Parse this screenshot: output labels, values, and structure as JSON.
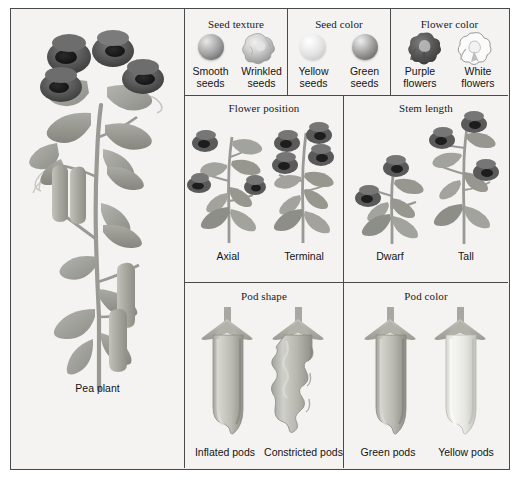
{
  "figure": {
    "background_color": "#f3f2f0",
    "border_color": "#4a4a4a"
  },
  "pea_panel": {
    "caption": "Pea plant",
    "icon": "pea-plant-illustration"
  },
  "trait_panels": [
    {
      "id": "seed-texture",
      "title": "Seed texture",
      "variants": [
        {
          "label_line1": "Smooth",
          "label_line2": "seeds",
          "icon": "smooth-seed-sphere-icon"
        },
        {
          "label_line1": "Wrinkled",
          "label_line2": "seeds",
          "icon": "wrinkled-seed-icon"
        }
      ]
    },
    {
      "id": "seed-color",
      "title": "Seed color",
      "variants": [
        {
          "label_line1": "Yellow",
          "label_line2": "seeds",
          "icon": "yellow-seed-sphere-icon"
        },
        {
          "label_line1": "Green",
          "label_line2": "seeds",
          "icon": "green-seed-sphere-icon"
        }
      ]
    },
    {
      "id": "flower-color",
      "title": "Flower color",
      "variants": [
        {
          "label_line1": "Purple",
          "label_line2": "flowers",
          "icon": "purple-flower-icon"
        },
        {
          "label_line1": "White",
          "label_line2": "flowers",
          "icon": "white-flower-icon"
        }
      ]
    },
    {
      "id": "flower-position",
      "title": "Flower position",
      "variants": [
        {
          "label_line1": "Axial",
          "label_line2": "",
          "icon": "axial-flower-plant-icon"
        },
        {
          "label_line1": "Terminal",
          "label_line2": "",
          "icon": "terminal-flower-plant-icon"
        }
      ]
    },
    {
      "id": "stem-length",
      "title": "Stem length",
      "variants": [
        {
          "label_line1": "Dwarf",
          "label_line2": "",
          "icon": "dwarf-stem-plant-icon"
        },
        {
          "label_line1": "Tall",
          "label_line2": "",
          "icon": "tall-stem-plant-icon"
        }
      ]
    },
    {
      "id": "pod-shape",
      "title": "Pod shape",
      "variants": [
        {
          "label_line1": "Inflated pods",
          "label_line2": "",
          "icon": "inflated-pod-icon"
        },
        {
          "label_line1": "Constricted pods",
          "label_line2": "",
          "icon": "constricted-pod-icon"
        }
      ]
    },
    {
      "id": "pod-color",
      "title": "Pod color",
      "variants": [
        {
          "label_line1": "Green pods",
          "label_line2": "",
          "icon": "green-pod-icon"
        },
        {
          "label_line1": "Yellow pods",
          "label_line2": "",
          "icon": "yellow-pod-icon"
        }
      ]
    }
  ],
  "colors": {
    "flower_dark": "#5b5b5b",
    "flower_mid": "#8d8d8d",
    "leaf": "#a6a6a0",
    "leaf_dark": "#8b8b86",
    "pod_green": "#b9b9b2",
    "pod_yellow": "#e2e2dd",
    "ink": "#141414"
  }
}
